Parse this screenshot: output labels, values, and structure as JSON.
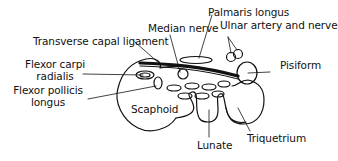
{
  "diagram": {
    "type": "anatomical cross-section",
    "colors": {
      "line": "#111111",
      "background": "#ffffff"
    },
    "labels": {
      "median_nerve": "Median nerve",
      "transverse_ligament": "Transverse capal ligament",
      "palmaris_longus": "Palmaris longus",
      "ulnar_artery_nerve": "Ulnar artery and nerve",
      "pisiform": "Pisiform",
      "fcr_line1": "Flexor carpi",
      "fcr_line2": "radialis",
      "fpl_line1": "Flexor pollicis",
      "fpl_line2": "longus",
      "scaphoid": "Scaphoid",
      "lunate": "Lunate",
      "triquetrium": "Triquetrium"
    }
  }
}
